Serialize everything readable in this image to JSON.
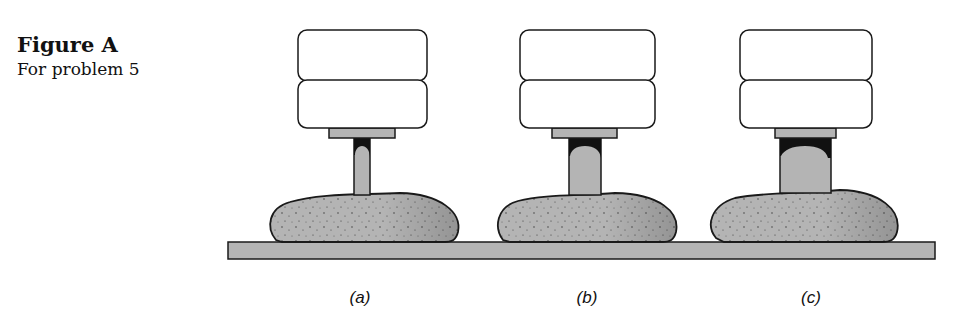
{
  "figure": {
    "title": "Figure A",
    "subtitle": "For problem 5"
  },
  "setups": [
    {
      "label": "(a)",
      "rod": "thin"
    },
    {
      "label": "(b)",
      "rod": "medium"
    },
    {
      "label": "(c)",
      "rod": "thick"
    }
  ],
  "colors": {
    "fill_gray": "#b4b4b4",
    "outline": "#1a1a1a",
    "weight_fill": "#ffffff"
  }
}
